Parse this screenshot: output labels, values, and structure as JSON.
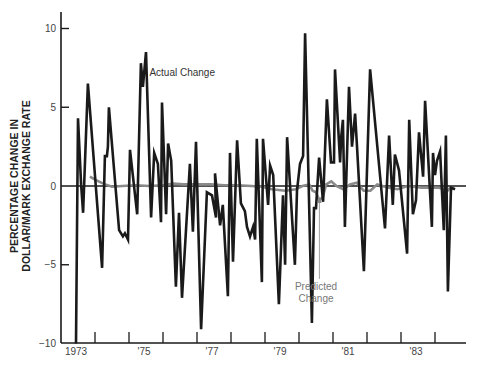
{
  "chart_data": {
    "type": "line",
    "title": "",
    "xlabel": "",
    "ylabel": "PERCENTAGE CHANGE IN DOLLAR/MARK EXCHANGE RATE",
    "ylabel_lines": [
      "PERCENTAGE CHANGE IN",
      "DOLLAR/MARK EXCHANGE RATE"
    ],
    "ylim": [
      -10,
      11
    ],
    "xlim": [
      1973,
      1984.2
    ],
    "y_ticks": [
      10,
      5,
      0,
      -5,
      -10
    ],
    "y_tick_labels": [
      "10",
      "5",
      "0",
      "−5",
      "−10"
    ],
    "x_tick_labels": [
      {
        "label": "1973",
        "x": 1973.5
      },
      {
        "label": "'75",
        "x": 1975.5
      },
      {
        "label": "'77",
        "x": 1977.5
      },
      {
        "label": "'79",
        "x": 1979.5
      },
      {
        "label": "'81",
        "x": 1981.5
      },
      {
        "label": "'83",
        "x": 1983.5
      }
    ],
    "x_tick_marks": [
      1974,
      1975,
      1976,
      1977,
      1978,
      1979,
      1980,
      1981,
      1982,
      1983,
      1984
    ],
    "zero_line": true,
    "grid": false,
    "legend": "inline annotations",
    "annotations": [
      {
        "text": "Actual Change",
        "series": "Actual Change",
        "x": 1975.6,
        "y": 7.2
      },
      {
        "text": "Predicted",
        "text2": "Change",
        "series": "Predicted Change",
        "x": 1980.5,
        "y": -6.6,
        "arrow_to": [
          1980.6,
          -0.7
        ]
      }
    ],
    "series": [
      {
        "name": "Actual Change",
        "color": "#1a1a1a",
        "points": [
          [
            1973.44,
            -10.0
          ],
          [
            1973.5,
            4.3
          ],
          [
            1973.59,
            0.1
          ],
          [
            1973.65,
            -1.7
          ],
          [
            1973.79,
            6.5
          ],
          [
            1974.21,
            -5.2
          ],
          [
            1974.29,
            1.9
          ],
          [
            1974.35,
            1.9
          ],
          [
            1974.38,
            2.5
          ],
          [
            1974.41,
            5.0
          ],
          [
            1974.71,
            -2.8
          ],
          [
            1974.82,
            -3.2
          ],
          [
            1974.88,
            -3.0
          ],
          [
            1974.97,
            -3.4
          ],
          [
            1975.03,
            2.3
          ],
          [
            1975.24,
            -1.8
          ],
          [
            1975.35,
            7.8
          ],
          [
            1975.41,
            6.3
          ],
          [
            1975.5,
            8.5
          ],
          [
            1975.65,
            -2.0
          ],
          [
            1975.74,
            2.1
          ],
          [
            1975.85,
            1.4
          ],
          [
            1975.94,
            -2.3
          ],
          [
            1975.97,
            5.3
          ],
          [
            1976.09,
            -1.8
          ],
          [
            1976.15,
            2.7
          ],
          [
            1976.24,
            1.6
          ],
          [
            1976.38,
            -6.4
          ],
          [
            1976.47,
            -1.7
          ],
          [
            1976.56,
            -7.1
          ],
          [
            1976.79,
            1.4
          ],
          [
            1976.88,
            -2.9
          ],
          [
            1976.97,
            2.8
          ],
          [
            1977.12,
            -9.1
          ],
          [
            1977.29,
            -0.4
          ],
          [
            1977.44,
            -0.6
          ],
          [
            1977.56,
            -2.0
          ],
          [
            1977.53,
            0.8
          ],
          [
            1977.68,
            -2.5
          ],
          [
            1977.76,
            -1.2
          ],
          [
            1977.91,
            -7.0
          ],
          [
            1977.97,
            2.1
          ],
          [
            1978.06,
            -4.8
          ],
          [
            1978.18,
            2.9
          ],
          [
            1978.29,
            -1.1
          ],
          [
            1978.41,
            -1.6
          ],
          [
            1978.47,
            -2.6
          ],
          [
            1978.56,
            -3.2
          ],
          [
            1978.65,
            -2.6
          ],
          [
            1978.71,
            -3.4
          ],
          [
            1978.76,
            3.0
          ],
          [
            1978.91,
            -6.1
          ],
          [
            1978.94,
            3.0
          ],
          [
            1979.09,
            -1.2
          ],
          [
            1979.15,
            1.3
          ],
          [
            1979.24,
            0.7
          ],
          [
            1979.41,
            -7.5
          ],
          [
            1979.53,
            -0.6
          ],
          [
            1979.59,
            -5.0
          ],
          [
            1979.65,
            3.1
          ],
          [
            1979.88,
            -5.0
          ],
          [
            1979.94,
            -0.3
          ],
          [
            1980.03,
            1.4
          ],
          [
            1980.12,
            1.9
          ],
          [
            1980.18,
            9.7
          ],
          [
            1980.38,
            -8.7
          ],
          [
            1980.44,
            -1.4
          ],
          [
            1980.5,
            -1.4
          ],
          [
            1980.59,
            1.8
          ],
          [
            1980.71,
            -1.0
          ],
          [
            1980.82,
            5.5
          ],
          [
            1980.94,
            1.5
          ],
          [
            1981.03,
            1.5
          ],
          [
            1981.06,
            7.4
          ],
          [
            1981.21,
            1.5
          ],
          [
            1981.24,
            3.1
          ],
          [
            1981.29,
            4.2
          ],
          [
            1981.35,
            -2.6
          ],
          [
            1981.47,
            6.3
          ],
          [
            1981.56,
            2.5
          ],
          [
            1981.65,
            4.6
          ],
          [
            1981.71,
            2.4
          ],
          [
            1981.91,
            -5.4
          ],
          [
            1982.09,
            7.4
          ],
          [
            1982.53,
            -2.7
          ],
          [
            1982.65,
            3.2
          ],
          [
            1982.76,
            -1.2
          ],
          [
            1982.82,
            2.0
          ],
          [
            1982.94,
            1.0
          ],
          [
            1983.18,
            -4.3
          ],
          [
            1983.24,
            4.2
          ],
          [
            1983.35,
            -1.8
          ],
          [
            1983.44,
            -0.9
          ],
          [
            1983.53,
            3.4
          ],
          [
            1983.65,
            0.6
          ],
          [
            1983.71,
            5.4
          ],
          [
            1983.91,
            -2.6
          ],
          [
            1983.94,
            2.1
          ],
          [
            1984.0,
            0.7
          ],
          [
            1984.06,
            1.6
          ],
          [
            1984.15,
            2.2
          ],
          [
            1984.26,
            -2.8
          ],
          [
            1984.32,
            3.2
          ],
          [
            1984.38,
            -6.7
          ],
          [
            1984.47,
            -0.1
          ],
          [
            1984.59,
            -0.2
          ]
        ]
      },
      {
        "name": "Predicted Change",
        "color": "#8a8a8a",
        "points": [
          [
            1973.85,
            0.6
          ],
          [
            1974.0,
            0.4
          ],
          [
            1974.15,
            0.25
          ],
          [
            1974.3,
            0.1
          ],
          [
            1974.5,
            -0.05
          ],
          [
            1974.8,
            0.0
          ],
          [
            1975.2,
            0.05
          ],
          [
            1975.6,
            0.0
          ],
          [
            1976.0,
            0.05
          ],
          [
            1976.3,
            0.15
          ],
          [
            1976.6,
            0.1
          ],
          [
            1977.0,
            0.1
          ],
          [
            1977.4,
            0.1
          ],
          [
            1977.8,
            0.05
          ],
          [
            1978.2,
            0.05
          ],
          [
            1978.6,
            0.0
          ],
          [
            1978.9,
            -0.05
          ],
          [
            1979.2,
            -0.2
          ],
          [
            1979.6,
            -0.3
          ],
          [
            1979.9,
            -0.2
          ],
          [
            1980.1,
            0.0
          ],
          [
            1980.3,
            0.1
          ],
          [
            1980.4,
            -0.3
          ],
          [
            1980.5,
            -0.4
          ],
          [
            1980.6,
            -0.9
          ],
          [
            1980.7,
            -0.7
          ],
          [
            1980.8,
            0.1
          ],
          [
            1980.95,
            0.3
          ],
          [
            1981.1,
            0.0
          ],
          [
            1981.3,
            -0.2
          ],
          [
            1981.5,
            0.1
          ],
          [
            1981.7,
            0.2
          ],
          [
            1981.9,
            -0.3
          ],
          [
            1982.1,
            -0.3
          ],
          [
            1982.3,
            0.1
          ],
          [
            1982.6,
            -0.1
          ],
          [
            1982.9,
            -0.2
          ],
          [
            1983.2,
            0.0
          ],
          [
            1983.6,
            -0.1
          ],
          [
            1983.9,
            -0.1
          ],
          [
            1984.1,
            -0.1
          ],
          [
            1984.25,
            -0.2
          ],
          [
            1984.3,
            -1.5
          ],
          [
            1984.33,
            -0.4
          ],
          [
            1984.45,
            -0.1
          ],
          [
            1984.55,
            -0.2
          ]
        ]
      }
    ]
  }
}
